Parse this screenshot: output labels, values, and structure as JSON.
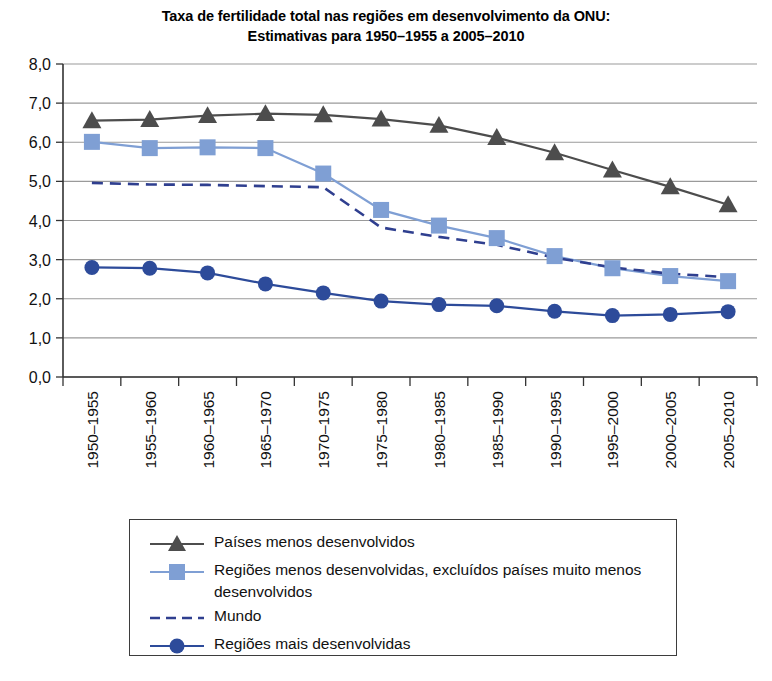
{
  "chart_data": {
    "type": "line",
    "title": "Taxa de fertilidade total nas regiões em desenvolvimento da ONU:",
    "subtitle": "Estimativas para 1950–1955 a 2005–2010",
    "xlabel": "",
    "ylabel": "",
    "ylim": [
      0.0,
      8.0
    ],
    "ytick_labels": [
      "8,0",
      "7,0",
      "6,0",
      "5,0",
      "4,0",
      "3,0",
      "2,0",
      "1,0",
      "0,0"
    ],
    "ytick_values": [
      8,
      7,
      6,
      5,
      4,
      3,
      2,
      1,
      0
    ],
    "grid": true,
    "grid_axis": "y",
    "legend_position": "bottom",
    "categories": [
      "1950–1955",
      "1955–1960",
      "1960–1965",
      "1965–1970",
      "1970–1975",
      "1975–1980",
      "1980–1985",
      "1985–1990",
      "1990–1995",
      "1995–2000",
      "2000–2005",
      "2005–2010"
    ],
    "series": [
      {
        "name": "Países menos desenvolvidos",
        "marker": "triangle",
        "line_style": "solid",
        "color": "#4d4d4d",
        "values": [
          6.55,
          6.58,
          6.68,
          6.73,
          6.7,
          6.59,
          6.43,
          6.12,
          5.73,
          5.29,
          4.86,
          4.4
        ]
      },
      {
        "name": "Regiões menos desenvolvidas, excluídos países muito menos desenvolvidos",
        "marker": "square",
        "line_style": "solid",
        "color": "#7f9fd4",
        "values": [
          6.01,
          5.85,
          5.87,
          5.85,
          5.2,
          4.27,
          3.87,
          3.55,
          3.09,
          2.78,
          2.58,
          2.45
        ]
      },
      {
        "name": "Mundo",
        "marker": "none",
        "line_style": "dashed",
        "color": "#2f3f8f",
        "values": [
          4.96,
          4.92,
          4.91,
          4.88,
          4.85,
          3.82,
          3.58,
          3.38,
          3.05,
          2.8,
          2.64,
          2.55
        ]
      },
      {
        "name": "Regiões mais desenvolvidas",
        "marker": "circle",
        "line_style": "solid",
        "color": "#2d4b9a",
        "values": [
          2.8,
          2.78,
          2.66,
          2.38,
          2.15,
          1.94,
          1.85,
          1.82,
          1.68,
          1.57,
          1.6,
          1.67
        ]
      }
    ]
  },
  "legend": {
    "entries": [
      "Países menos desenvolvidos",
      "Regiões menos desenvolvidas, excluídos países muito menos desenvolvidos",
      "Mundo",
      "Regiões mais desenvolvidas"
    ]
  }
}
